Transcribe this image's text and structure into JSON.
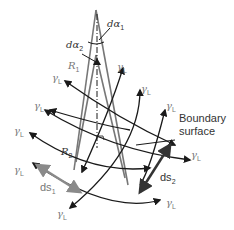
{
  "diagram": {
    "labels": {
      "d_alpha_1": "dα",
      "d_alpha_1_sub": "1",
      "d_alpha_2": "dα",
      "d_alpha_2_sub": "2",
      "R1": "R",
      "R1_sub": "1",
      "R2": "R",
      "R2_sub": "2",
      "gamma": "γ",
      "gamma_sub": "L",
      "ds1": "ds",
      "ds1_sub": "1",
      "ds2": "ds",
      "ds2_sub": "2",
      "boundary_line1": "Boundary",
      "boundary_line2": "surface"
    },
    "colors": {
      "lines": "#1a1a1a",
      "cone": "#777777",
      "ds1_arrow": "#8a8a8a",
      "ds2_arrow": "#333333"
    }
  }
}
